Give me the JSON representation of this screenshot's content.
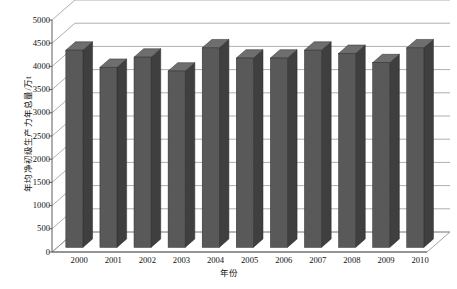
{
  "chart_data": {
    "type": "bar",
    "title": "",
    "subtitle": "",
    "xlabel": "年份",
    "ylabel": "年均净初级生产力年总量/万t",
    "categories": [
      "2000",
      "2001",
      "2002",
      "2003",
      "2004",
      "2005",
      "2006",
      "2007",
      "2008",
      "2009",
      "2010"
    ],
    "values": [
      4250,
      3880,
      4100,
      3800,
      4300,
      4080,
      4080,
      4250,
      4180,
      3980,
      4300
    ],
    "series": [
      {
        "name": "年均净初级生产力年总量",
        "values": [
          4250,
          3880,
          4100,
          3800,
          4300,
          4080,
          4080,
          4250,
          4180,
          3980,
          4300
        ]
      }
    ],
    "ylim": [
      0,
      5000
    ],
    "ytick_step": 500,
    "yticks": [
      "5000",
      "4500",
      "4000",
      "3500",
      "3000",
      "2500",
      "2000",
      "1500",
      "1000",
      "500",
      "0"
    ],
    "ytick_values": [
      5000,
      4500,
      4000,
      3500,
      3000,
      2500,
      2000,
      1500,
      1000,
      500,
      0
    ],
    "xticks": [
      "2000",
      "2001",
      "2002",
      "2003",
      "2004",
      "2005",
      "2006",
      "2007",
      "2008",
      "2009",
      "2010"
    ],
    "grid": true,
    "grid_axis": "y",
    "legend": false,
    "legend_position": "none",
    "three_d": true,
    "annotations": [],
    "colors": {
      "bar_front": "#595959",
      "bar_side": "#3f3f3f",
      "bar_top": "#6e6e6e",
      "grid_line": "#8c8c8c",
      "axis_line": "#4d4d4d",
      "floor": "#ffffff",
      "background": "#ffffff",
      "text": "#111111"
    }
  }
}
